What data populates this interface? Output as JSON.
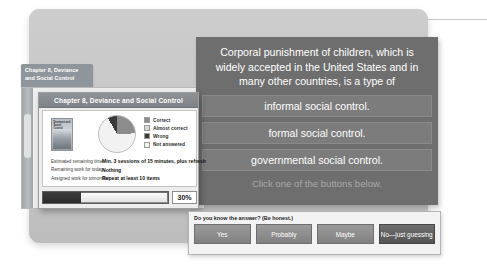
{
  "callout": {
    "marker": "annotation-dot"
  },
  "background_window": {
    "tab_label": "Chapter 8, Deviance\nand Social Control"
  },
  "slide": {
    "stem": "Corporal punishment of children, which is widely accepted in the United States and in many other countries, is a type of",
    "options": [
      "informal social control.",
      "formal social control.",
      "governmental social control."
    ],
    "hint": "Click one of the buttons below."
  },
  "dialog": {
    "title": "Chapter 8, Deviance and Social Control",
    "book_cover_title": "Deviance and Social Control",
    "legend": [
      {
        "label": "Correct",
        "color": "#8c8c8c"
      },
      {
        "label": "Almost correct",
        "color": "#d9d9d9"
      },
      {
        "label": "Wrong",
        "color": "#3a3a3a"
      },
      {
        "label": "Not answered",
        "color": "#f2f2f2"
      }
    ],
    "stats": [
      {
        "label": "Estimated remaining time:",
        "value": "Min. 3 sessions of 15 minutes, plus refresh"
      },
      {
        "label": "Remaining work for today:",
        "value": "Nothing"
      },
      {
        "label": "Assigned work for tomorrow:",
        "value": "Repeat at least 10 items"
      }
    ],
    "progress": {
      "percent_label": "30%",
      "percent_value": 30
    }
  },
  "honest_bar": {
    "question": "Do you know the answer? (Be honest.)",
    "buttons": [
      "Yes",
      "Probably",
      "Maybe",
      "No—just guessing"
    ]
  },
  "chart_data": {
    "type": "pie",
    "categories": [
      "Correct",
      "Almost correct",
      "Wrong",
      "Not answered"
    ],
    "values": [
      24,
      0,
      8,
      68
    ],
    "colors": [
      "#8c8c8c",
      "#d9d9d9",
      "#3a3a3a",
      "#f2f2f2"
    ],
    "legend_position": "right",
    "grid": false
  }
}
